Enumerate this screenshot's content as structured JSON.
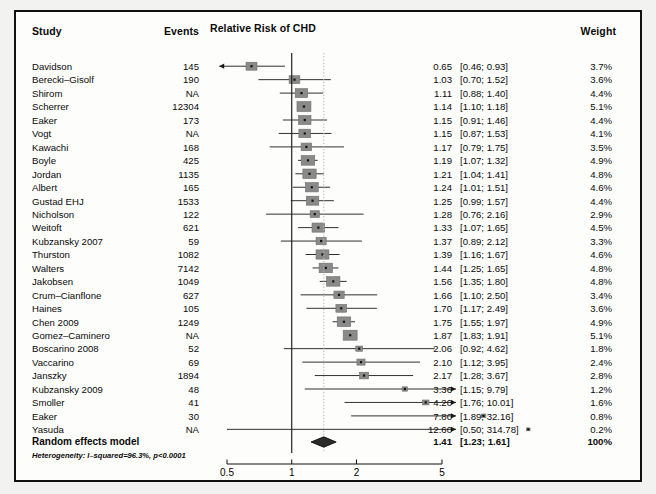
{
  "figure": {
    "title": "Relative Risk of CHD",
    "columns": {
      "study": "Study",
      "events": "Events",
      "weight": "Weight"
    },
    "summary_label": "Random effects model",
    "heterogeneity": "Heterogeneity: I–squared=96.3%, p<0.0001",
    "summary": {
      "estimate": "1.41",
      "ci": "[1.23;  1.61]",
      "weight": "100%"
    }
  },
  "chart_data": {
    "type": "forest",
    "title": "Relative Risk of CHD",
    "xlabel": "",
    "ylabel": "",
    "xscale": "log",
    "xlim": [
      0.5,
      5
    ],
    "xticks": [
      0.5,
      1,
      2,
      5
    ],
    "xtick_labels": [
      "0.5",
      "1",
      "2",
      "5"
    ],
    "reference_line": 1,
    "summary_line": 1.41,
    "grid": false,
    "legend": "none",
    "columns": [
      "Study",
      "Events",
      "Relative Risk of CHD",
      "Weight"
    ],
    "rows": [
      {
        "study": "Davidson",
        "events": "145",
        "rr": 0.65,
        "lo": 0.46,
        "hi": 0.93,
        "estimate": "0.65",
        "ci": "[0.46;  0.93]",
        "weight": "3.7%",
        "w": 3.7,
        "arrow_left": true,
        "arrow_right": false
      },
      {
        "study": "Berecki–Gisolf",
        "events": "190",
        "rr": 1.03,
        "lo": 0.7,
        "hi": 1.52,
        "estimate": "1.03",
        "ci": "[0.70;  1.52]",
        "weight": "3.6%",
        "w": 3.6,
        "arrow_left": false,
        "arrow_right": false
      },
      {
        "study": "Shirom",
        "events": "NA",
        "rr": 1.11,
        "lo": 0.88,
        "hi": 1.4,
        "estimate": "1.11",
        "ci": "[0.88;  1.40]",
        "weight": "4.4%",
        "w": 4.4,
        "arrow_left": false,
        "arrow_right": false
      },
      {
        "study": "Scherrer",
        "events": "12304",
        "rr": 1.14,
        "lo": 1.1,
        "hi": 1.18,
        "estimate": "1.14",
        "ci": "[1.10;  1.18]",
        "weight": "5.1%",
        "w": 5.1,
        "arrow_left": false,
        "arrow_right": false
      },
      {
        "study": "Eaker",
        "events": "173",
        "rr": 1.15,
        "lo": 0.91,
        "hi": 1.46,
        "estimate": "1.15",
        "ci": "[0.91;  1.46]",
        "weight": "4.4%",
        "w": 4.4,
        "arrow_left": false,
        "arrow_right": false
      },
      {
        "study": "Vogt",
        "events": "NA",
        "rr": 1.15,
        "lo": 0.87,
        "hi": 1.53,
        "estimate": "1.15",
        "ci": "[0.87;  1.53]",
        "weight": "4.1%",
        "w": 4.1,
        "arrow_left": false,
        "arrow_right": false
      },
      {
        "study": "Kawachi",
        "events": "168",
        "rr": 1.17,
        "lo": 0.79,
        "hi": 1.75,
        "estimate": "1.17",
        "ci": "[0.79;  1.75]",
        "weight": "3.5%",
        "w": 3.5,
        "arrow_left": false,
        "arrow_right": false
      },
      {
        "study": "Boyle",
        "events": "425",
        "rr": 1.19,
        "lo": 1.07,
        "hi": 1.32,
        "estimate": "1.19",
        "ci": "[1.07;  1.32]",
        "weight": "4.9%",
        "w": 4.9,
        "arrow_left": false,
        "arrow_right": false
      },
      {
        "study": "Jordan",
        "events": "1135",
        "rr": 1.21,
        "lo": 1.04,
        "hi": 1.41,
        "estimate": "1.21",
        "ci": "[1.04;  1.41]",
        "weight": "4.8%",
        "w": 4.8,
        "arrow_left": false,
        "arrow_right": false
      },
      {
        "study": "Albert",
        "events": "165",
        "rr": 1.24,
        "lo": 1.01,
        "hi": 1.51,
        "estimate": "1.24",
        "ci": "[1.01;  1.51]",
        "weight": "4.6%",
        "w": 4.6,
        "arrow_left": false,
        "arrow_right": false
      },
      {
        "study": "Gustad EHJ",
        "events": "1533",
        "rr": 1.25,
        "lo": 0.99,
        "hi": 1.57,
        "estimate": "1.25",
        "ci": "[0.99;  1.57]",
        "weight": "4.4%",
        "w": 4.4,
        "arrow_left": false,
        "arrow_right": false
      },
      {
        "study": "Nicholson",
        "events": "122",
        "rr": 1.28,
        "lo": 0.76,
        "hi": 2.16,
        "estimate": "1.28",
        "ci": "[0.76;  2.16]",
        "weight": "2.9%",
        "w": 2.9,
        "arrow_left": false,
        "arrow_right": false
      },
      {
        "study": "Weitoft",
        "events": "621",
        "rr": 1.33,
        "lo": 1.07,
        "hi": 1.65,
        "estimate": "1.33",
        "ci": "[1.07;  1.65]",
        "weight": "4.5%",
        "w": 4.5,
        "arrow_left": false,
        "arrow_right": false
      },
      {
        "study": "Kubzansky 2007",
        "events": "59",
        "rr": 1.37,
        "lo": 0.89,
        "hi": 2.12,
        "estimate": "1.37",
        "ci": "[0.89;  2.12]",
        "weight": "3.3%",
        "w": 3.3,
        "arrow_left": false,
        "arrow_right": false
      },
      {
        "study": "Thurston",
        "events": "1082",
        "rr": 1.39,
        "lo": 1.16,
        "hi": 1.67,
        "estimate": "1.39",
        "ci": "[1.16;  1.67]",
        "weight": "4.6%",
        "w": 4.6,
        "arrow_left": false,
        "arrow_right": false
      },
      {
        "study": "Walters",
        "events": "7142",
        "rr": 1.44,
        "lo": 1.25,
        "hi": 1.65,
        "estimate": "1.44",
        "ci": "[1.25;  1.65]",
        "weight": "4.8%",
        "w": 4.8,
        "arrow_left": false,
        "arrow_right": false
      },
      {
        "study": "Jakobsen",
        "events": "1049",
        "rr": 1.56,
        "lo": 1.35,
        "hi": 1.8,
        "estimate": "1.56",
        "ci": "[1.35;  1.80]",
        "weight": "4.8%",
        "w": 4.8,
        "arrow_left": false,
        "arrow_right": false
      },
      {
        "study": "Crum–Cianflone",
        "events": "627",
        "rr": 1.66,
        "lo": 1.1,
        "hi": 2.5,
        "estimate": "1.66",
        "ci": "[1.10;  2.50]",
        "weight": "3.4%",
        "w": 3.4,
        "arrow_left": false,
        "arrow_right": false
      },
      {
        "study": "Haines",
        "events": "105",
        "rr": 1.7,
        "lo": 1.17,
        "hi": 2.49,
        "estimate": "1.70",
        "ci": "[1.17;  2.49]",
        "weight": "3.6%",
        "w": 3.6,
        "arrow_left": false,
        "arrow_right": false
      },
      {
        "study": "Chen 2009",
        "events": "1249",
        "rr": 1.75,
        "lo": 1.55,
        "hi": 1.97,
        "estimate": "1.75",
        "ci": "[1.55;  1.97]",
        "weight": "4.9%",
        "w": 4.9,
        "arrow_left": false,
        "arrow_right": false
      },
      {
        "study": "Gomez–Caminero",
        "events": "NA",
        "rr": 1.87,
        "lo": 1.83,
        "hi": 1.91,
        "estimate": "1.87",
        "ci": "[1.83;  1.91]",
        "weight": "5.1%",
        "w": 5.1,
        "arrow_left": false,
        "arrow_right": false
      },
      {
        "study": "Boscarino 2008",
        "events": "52",
        "rr": 2.06,
        "lo": 0.92,
        "hi": 4.62,
        "estimate": "2.06",
        "ci": "[0.92;  4.62]",
        "weight": "1.8%",
        "w": 1.8,
        "arrow_left": false,
        "arrow_right": false
      },
      {
        "study": "Vaccarino",
        "events": "69",
        "rr": 2.1,
        "lo": 1.12,
        "hi": 3.95,
        "estimate": "2.10",
        "ci": "[1.12;  3.95]",
        "weight": "2.4%",
        "w": 2.4,
        "arrow_left": false,
        "arrow_right": false
      },
      {
        "study": "Janszky",
        "events": "1894",
        "rr": 2.17,
        "lo": 1.28,
        "hi": 3.67,
        "estimate": "2.17",
        "ci": "[1.28;  3.67]",
        "weight": "2.8%",
        "w": 2.8,
        "arrow_left": false,
        "arrow_right": false
      },
      {
        "study": "Kubzansky 2009",
        "events": "48",
        "rr": 3.36,
        "lo": 1.15,
        "hi": 9.79,
        "estimate": "3.36",
        "ci": "[1.15;  9.79]",
        "weight": "1.2%",
        "w": 1.2,
        "arrow_left": false,
        "arrow_right": true
      },
      {
        "study": "Smoller",
        "events": "41",
        "rr": 4.2,
        "lo": 1.76,
        "hi": 10.01,
        "estimate": "4.20",
        "ci": "[1.76; 10.01]",
        "weight": "1.6%",
        "w": 1.6,
        "arrow_left": false,
        "arrow_right": true
      },
      {
        "study": "Eaker",
        "events": "30",
        "rr": 7.8,
        "lo": 1.89,
        "hi": 32.16,
        "estimate": "7.80",
        "ci": "[1.89; 32.16]",
        "weight": "0.8%",
        "w": 0.8,
        "arrow_left": false,
        "arrow_right": true
      },
      {
        "study": "Yasuda",
        "events": "NA",
        "rr": 12.6,
        "lo": 0.5,
        "hi": 314.78,
        "estimate": "12.60",
        "ci": "[0.50; 314.78]",
        "weight": "0.2%",
        "w": 0.2,
        "arrow_left": false,
        "arrow_right": true
      }
    ],
    "summary_row": {
      "label": "Random effects model",
      "estimate": "1.41",
      "ci": "[1.23;  1.61]",
      "weight": "100%",
      "rr": 1.41,
      "lo": 1.23,
      "hi": 1.61
    },
    "colors": {
      "box": "#8a8a8a",
      "line": "#1a1a1a",
      "reference": "#1a1a1a",
      "summary_dotted": "#b9b9b9",
      "diamond": "#2b2b2b",
      "text": "#0a0a0a"
    }
  }
}
